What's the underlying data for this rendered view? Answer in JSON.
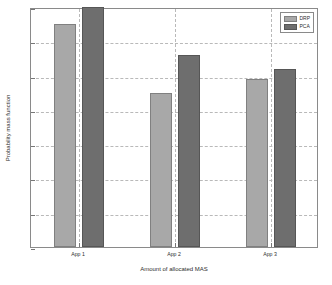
{
  "chart_data": {
    "type": "bar",
    "title": "",
    "xlabel": "Amount of allocated MAS",
    "ylabel": "Probability mass function",
    "categories": [
      "App 1",
      "App 2",
      "App 3"
    ],
    "series": [
      {
        "name": "DRP",
        "values": [
          0.65,
          0.45,
          0.49
        ],
        "color": "#a8a8a8"
      },
      {
        "name": "PCA",
        "values": [
          0.7,
          0.56,
          0.52
        ],
        "color": "#6e6e6e"
      }
    ],
    "ylim": [
      0,
      0.7
    ],
    "yticks": [
      0,
      0.1,
      0.2,
      0.3,
      0.4,
      0.5,
      0.6,
      0.7
    ],
    "ytick_labels": [
      "0",
      "0.1",
      "0.2",
      "0.3",
      "0.4",
      "0.5",
      "0.6",
      "0.7"
    ],
    "grid": true,
    "grid_style": "dashed",
    "legend_position": "top-right"
  },
  "legend": {
    "entries": [
      {
        "label": "DRP"
      },
      {
        "label": "PCA"
      }
    ]
  },
  "axes": {
    "xlabel": "Amount of allocated MAS",
    "ylabel": "Probability mass function"
  }
}
